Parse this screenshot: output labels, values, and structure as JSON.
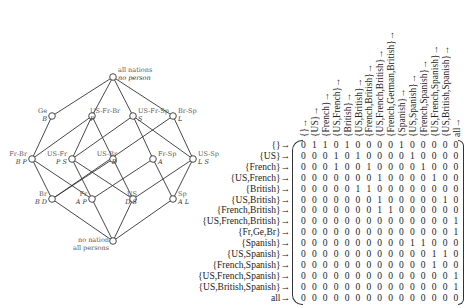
{
  "lattice": {
    "nodes": [
      {
        "id": "top",
        "attr": "all nations",
        "obj": "no person",
        "x": 113,
        "y": 77
      },
      {
        "id": "ge",
        "attr": "Ge",
        "obj": "B",
        "x": 52,
        "y": 116
      },
      {
        "id": "us-fr-br",
        "attr": "US-Fr-Br",
        "obj": "P",
        "x": 92,
        "y": 116
      },
      {
        "id": "us-fr-sp",
        "attr": "US-Fr-Sp",
        "obj": "S",
        "x": 133,
        "y": 116
      },
      {
        "id": "br-sp",
        "attr": "Br-Sp",
        "obj": "L",
        "x": 173,
        "y": 116
      },
      {
        "id": "fr-br",
        "attr": "Fr-Br",
        "obj": "B P",
        "x": 32,
        "y": 159
      },
      {
        "id": "us-fr",
        "attr": "US-Fr",
        "obj": "P S",
        "x": 72,
        "y": 159
      },
      {
        "id": "us-br",
        "attr": "US-Br",
        "obj": "D",
        "x": 113,
        "y": 159
      },
      {
        "id": "fr-sp",
        "attr": "Fr-Sp",
        "obj": "A",
        "x": 153,
        "y": 159
      },
      {
        "id": "us-sp",
        "attr": "US-Sp",
        "obj": "L S",
        "x": 193,
        "y": 159
      },
      {
        "id": "br",
        "attr": "Br",
        "obj": "B D",
        "x": 52,
        "y": 199
      },
      {
        "id": "fr",
        "attr": "Fr",
        "obj": "A P",
        "x": 92,
        "y": 199
      },
      {
        "id": "us",
        "attr": "US",
        "obj": "D S",
        "x": 133,
        "y": 199
      },
      {
        "id": "sp",
        "attr": "Sp",
        "obj": "A L",
        "x": 173,
        "y": 199
      },
      {
        "id": "bottom",
        "attr": "no nation",
        "obj": "all persons",
        "x": 113,
        "y": 241
      }
    ],
    "edges": [
      [
        "top",
        "ge"
      ],
      [
        "top",
        "us-fr-br"
      ],
      [
        "top",
        "us-fr-sp"
      ],
      [
        "top",
        "br-sp"
      ],
      [
        "ge",
        "fr-br"
      ],
      [
        "us-fr-br",
        "fr-br"
      ],
      [
        "us-fr-br",
        "us-fr"
      ],
      [
        "us-fr-br",
        "us-br"
      ],
      [
        "us-fr-sp",
        "us-fr"
      ],
      [
        "us-fr-sp",
        "fr-sp"
      ],
      [
        "us-fr-sp",
        "us-sp"
      ],
      [
        "br-sp",
        "us-sp"
      ],
      [
        "br-sp",
        "br"
      ],
      [
        "fr-br",
        "br"
      ],
      [
        "fr-br",
        "fr"
      ],
      [
        "us-fr",
        "fr"
      ],
      [
        "us-fr",
        "us"
      ],
      [
        "us-br",
        "br"
      ],
      [
        "us-br",
        "us"
      ],
      [
        "fr-sp",
        "fr"
      ],
      [
        "fr-sp",
        "sp"
      ],
      [
        "us-sp",
        "us"
      ],
      [
        "us-sp",
        "sp"
      ],
      [
        "br",
        "bottom"
      ],
      [
        "fr",
        "bottom"
      ],
      [
        "us",
        "bottom"
      ],
      [
        "sp",
        "bottom"
      ]
    ]
  },
  "matrix": {
    "arrow_right": "→",
    "arrow_up": "↑",
    "columns": [
      "{}",
      "{US}",
      "{French}",
      "{US,French}",
      "{British}",
      "{US,British}",
      "{French,British}",
      "{US,French,British}",
      "{French,German,British}",
      "{Spanish}",
      "{US,Spanish}",
      "{French,Spanish}",
      "{US,French,Spanish}",
      "{US,British,Spanish}",
      "all"
    ],
    "rows": [
      "{}",
      "{US}",
      "{French}",
      "{US,French}",
      "{British}",
      "{US,British}",
      "{French,British}",
      "{US,French,British}",
      "{Fr,Ge,Br}",
      "{Spanish}",
      "{US,Spanish}",
      "{French,Spanish}",
      "{US,French,Spanish}",
      "{US,British,Spanish}",
      "all"
    ],
    "values": [
      [
        0,
        1,
        1,
        0,
        1,
        0,
        0,
        0,
        0,
        1,
        0,
        0,
        0,
        0,
        0
      ],
      [
        0,
        0,
        0,
        1,
        0,
        1,
        0,
        0,
        0,
        0,
        1,
        0,
        0,
        0,
        0
      ],
      [
        0,
        0,
        0,
        1,
        0,
        0,
        1,
        0,
        0,
        0,
        0,
        1,
        0,
        0,
        0
      ],
      [
        0,
        0,
        0,
        0,
        0,
        0,
        0,
        1,
        0,
        0,
        0,
        0,
        1,
        0,
        0
      ],
      [
        0,
        0,
        0,
        0,
        0,
        1,
        1,
        0,
        0,
        0,
        0,
        0,
        0,
        0,
        0
      ],
      [
        0,
        0,
        0,
        0,
        0,
        0,
        0,
        1,
        0,
        0,
        0,
        0,
        0,
        1,
        0
      ],
      [
        0,
        0,
        0,
        0,
        0,
        0,
        0,
        1,
        1,
        0,
        0,
        0,
        0,
        0,
        0
      ],
      [
        0,
        0,
        0,
        0,
        0,
        0,
        0,
        0,
        0,
        0,
        0,
        0,
        0,
        0,
        1
      ],
      [
        0,
        0,
        0,
        0,
        0,
        0,
        0,
        0,
        0,
        0,
        0,
        0,
        0,
        0,
        1
      ],
      [
        0,
        0,
        0,
        0,
        0,
        0,
        0,
        0,
        0,
        0,
        1,
        1,
        0,
        0,
        0
      ],
      [
        0,
        0,
        0,
        0,
        0,
        0,
        0,
        0,
        0,
        0,
        0,
        0,
        1,
        1,
        0
      ],
      [
        0,
        0,
        0,
        0,
        0,
        0,
        0,
        0,
        0,
        0,
        0,
        0,
        1,
        0,
        0
      ],
      [
        0,
        0,
        0,
        0,
        0,
        0,
        0,
        0,
        0,
        0,
        0,
        0,
        0,
        0,
        1
      ],
      [
        0,
        0,
        0,
        0,
        0,
        0,
        0,
        0,
        0,
        0,
        0,
        0,
        0,
        0,
        1
      ],
      [
        0,
        0,
        0,
        0,
        0,
        0,
        0,
        0,
        0,
        0,
        0,
        0,
        0,
        0,
        0
      ]
    ]
  }
}
